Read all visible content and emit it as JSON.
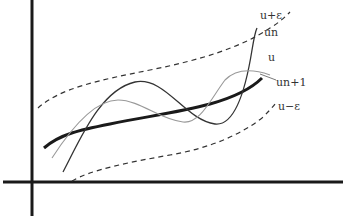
{
  "diagram": {
    "title": "",
    "labels": {
      "upper_band": "u+ε",
      "un": "un",
      "u": "u",
      "un1": "un+1",
      "lower_band": "u−ε"
    },
    "colors": {
      "axis": "#1a1a1a",
      "u": "#1a1a1a",
      "un": "#333333",
      "un1": "#999999",
      "band": "#333333"
    }
  }
}
